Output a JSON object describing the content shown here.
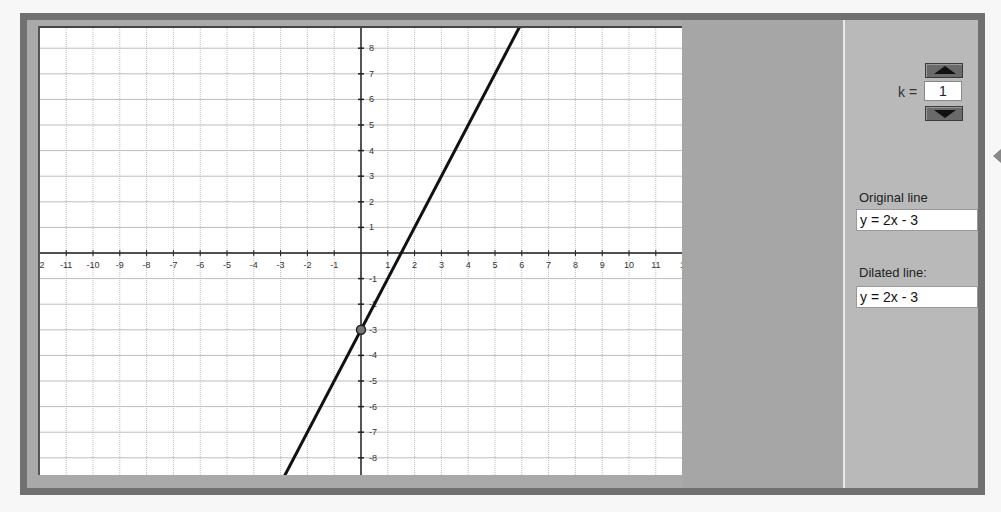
{
  "controls": {
    "k_label": "k =",
    "k_value": "1",
    "up_button": "increase-k",
    "down_button": "decrease-k"
  },
  "original": {
    "label": "Original line",
    "equation": "y = 2x - 3"
  },
  "dilated": {
    "label": "Dilated line:",
    "equation": "y = 2x - 3"
  },
  "graph": {
    "x_ticks": [
      "12",
      "-11",
      "-10",
      "-9",
      "-8",
      "-7",
      "-6",
      "-5",
      "-4",
      "-3",
      "-2",
      "-1",
      "1",
      "2",
      "3",
      "4",
      "5",
      "6",
      "7",
      "8",
      "9",
      "10",
      "11",
      "1"
    ],
    "y_ticks": [
      "8",
      "7",
      "6",
      "5",
      "4",
      "3",
      "2",
      "1",
      "-1",
      "-2",
      "-3",
      "-4",
      "-5",
      "-6",
      "-7",
      "-8"
    ],
    "line": {
      "slope": 2,
      "intercept": -3
    },
    "point": {
      "x": 0,
      "y": -3
    },
    "colors": {
      "line": "#111111",
      "grid": "#bdbdbd",
      "axis": "#222222"
    }
  }
}
